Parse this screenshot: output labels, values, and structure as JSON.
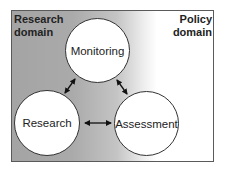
{
  "diagram": {
    "domains": {
      "left": {
        "line1": "Research",
        "line2": "domain"
      },
      "right": {
        "line1": "Policy",
        "line2": "domain"
      }
    },
    "nodes": [
      {
        "id": "monitoring",
        "label": "Monitoring"
      },
      {
        "id": "research",
        "label": "Research"
      },
      {
        "id": "assessment",
        "label": "Assessment"
      }
    ],
    "edges": [
      {
        "from": "monitoring",
        "to": "research",
        "type": "bidirectional"
      },
      {
        "from": "monitoring",
        "to": "assessment",
        "type": "bidirectional"
      },
      {
        "from": "research",
        "to": "assessment",
        "type": "bidirectional"
      }
    ],
    "colors": {
      "gradient_left": "#a4a4a4",
      "gradient_right": "#ffffff",
      "border": "#5a5a5a",
      "node_fill": "#ffffff",
      "text": "#222222"
    }
  }
}
